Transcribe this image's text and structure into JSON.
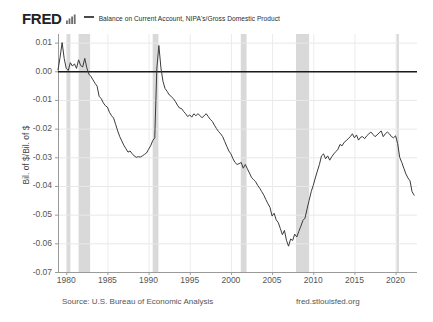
{
  "header": {
    "logo_text": "FRED",
    "logo_icon": "bar-chart-icon",
    "series_legend_label": "Balance on Current Account, NIPA's/Gross Domestic Product"
  },
  "footer": {
    "source": "Source: U.S. Bureau of Economic Analysis",
    "url": "fred.stlouisfed.org"
  },
  "chart_data": {
    "type": "line",
    "title": "Balance on Current Account, NIPA's/Gross Domestic Product",
    "xlabel": "",
    "ylabel": "Bil. of $/Bil. of $",
    "xlim": [
      1979.0,
      2022.6
    ],
    "ylim": [
      -0.07,
      0.013
    ],
    "grid": true,
    "legend_position": "top",
    "line_color": "#3b3b3b",
    "zero_line_color": "#1a1a1a",
    "recession_band_color": "#d9d9d9",
    "xticks": [
      1980,
      1985,
      1990,
      1995,
      2000,
      2005,
      2010,
      2015,
      2020
    ],
    "xticklabels": [
      "1980",
      "1985",
      "1990",
      "1995",
      "2000",
      "2005",
      "2010",
      "2015",
      "2020"
    ],
    "yticks": [
      0.01,
      0.0,
      -0.01,
      -0.02,
      -0.03,
      -0.04,
      -0.05,
      -0.06,
      -0.07
    ],
    "yticklabels": [
      "0.01",
      "0.00",
      "-0.01",
      "-0.02",
      "-0.03",
      "-0.04",
      "-0.05",
      "-0.06",
      "-0.07"
    ],
    "recessions": [
      {
        "start": 1980.0,
        "end": 1980.5
      },
      {
        "start": 1981.5,
        "end": 1982.9
      },
      {
        "start": 1990.5,
        "end": 1991.2
      },
      {
        "start": 2001.2,
        "end": 2001.9
      },
      {
        "start": 2007.9,
        "end": 2009.5
      },
      {
        "start": 2020.1,
        "end": 2020.4
      }
    ],
    "series": [
      {
        "name": "Balance on Current Account, NIPA's/Gross Domestic Product",
        "x": [
          1979.0,
          1979.25,
          1979.5,
          1979.75,
          1980.0,
          1980.25,
          1980.5,
          1980.75,
          1981.0,
          1981.25,
          1981.5,
          1981.75,
          1982.0,
          1982.25,
          1982.5,
          1982.75,
          1983.0,
          1983.25,
          1983.5,
          1983.75,
          1984.0,
          1984.25,
          1984.5,
          1984.75,
          1985.0,
          1985.25,
          1985.5,
          1985.75,
          1986.0,
          1986.25,
          1986.5,
          1986.75,
          1987.0,
          1987.25,
          1987.5,
          1987.75,
          1988.0,
          1988.25,
          1988.5,
          1988.75,
          1989.0,
          1989.25,
          1989.5,
          1989.75,
          1990.0,
          1990.25,
          1990.5,
          1990.75,
          1991.0,
          1991.25,
          1991.5,
          1991.75,
          1992.0,
          1992.25,
          1992.5,
          1992.75,
          1993.0,
          1993.25,
          1993.5,
          1993.75,
          1994.0,
          1994.25,
          1994.5,
          1994.75,
          1995.0,
          1995.25,
          1995.5,
          1995.75,
          1996.0,
          1996.25,
          1996.5,
          1996.75,
          1997.0,
          1997.25,
          1997.5,
          1997.75,
          1998.0,
          1998.25,
          1998.5,
          1998.75,
          1999.0,
          1999.25,
          1999.5,
          1999.75,
          2000.0,
          2000.25,
          2000.5,
          2000.75,
          2001.0,
          2001.25,
          2001.5,
          2001.75,
          2002.0,
          2002.25,
          2002.5,
          2002.75,
          2003.0,
          2003.25,
          2003.5,
          2003.75,
          2004.0,
          2004.25,
          2004.5,
          2004.75,
          2005.0,
          2005.25,
          2005.5,
          2005.75,
          2006.0,
          2006.25,
          2006.5,
          2006.75,
          2007.0,
          2007.25,
          2007.5,
          2007.75,
          2008.0,
          2008.25,
          2008.5,
          2008.75,
          2009.0,
          2009.25,
          2009.5,
          2009.75,
          2010.0,
          2010.25,
          2010.5,
          2010.75,
          2011.0,
          2011.25,
          2011.5,
          2011.75,
          2012.0,
          2012.25,
          2012.5,
          2012.75,
          2013.0,
          2013.25,
          2013.5,
          2013.75,
          2014.0,
          2014.25,
          2014.5,
          2014.75,
          2015.0,
          2015.25,
          2015.5,
          2015.75,
          2016.0,
          2016.25,
          2016.5,
          2016.75,
          2017.0,
          2017.25,
          2017.5,
          2017.75,
          2018.0,
          2018.25,
          2018.5,
          2018.75,
          2019.0,
          2019.25,
          2019.5,
          2019.75,
          2020.0,
          2020.25,
          2020.5,
          2020.75,
          2021.0,
          2021.25,
          2021.5,
          2021.75,
          2022.0,
          2022.25
        ],
        "y": [
          0.0005,
          0.0048,
          0.01,
          0.0045,
          0.001,
          0.0003,
          0.003,
          0.0018,
          0.0026,
          0.001,
          0.004,
          0.002,
          0.0015,
          0.0045,
          0.0012,
          -0.001,
          -0.0018,
          -0.003,
          -0.0042,
          -0.0052,
          -0.0088,
          -0.0095,
          -0.011,
          -0.012,
          -0.0125,
          -0.0143,
          -0.0155,
          -0.0163,
          -0.0185,
          -0.0208,
          -0.0228,
          -0.0243,
          -0.0258,
          -0.027,
          -0.0282,
          -0.0278,
          -0.0287,
          -0.0295,
          -0.03,
          -0.0298,
          -0.0299,
          -0.0295,
          -0.029,
          -0.0285,
          -0.0272,
          -0.026,
          -0.0242,
          -0.0232,
          0.0008,
          0.009,
          0.0012,
          -0.0035,
          -0.006,
          -0.007,
          -0.0082,
          -0.0088,
          -0.0095,
          -0.0105,
          -0.0118,
          -0.0128,
          -0.013,
          -0.014,
          -0.0148,
          -0.0158,
          -0.0152,
          -0.016,
          -0.0148,
          -0.0155,
          -0.0148,
          -0.0155,
          -0.0162,
          -0.0155,
          -0.0148,
          -0.0158,
          -0.0168,
          -0.0175,
          -0.0188,
          -0.02,
          -0.021,
          -0.0218,
          -0.0228,
          -0.0245,
          -0.0262,
          -0.0278,
          -0.0288,
          -0.0305,
          -0.0318,
          -0.0325,
          -0.0322,
          -0.0318,
          -0.0338,
          -0.0325,
          -0.034,
          -0.0355,
          -0.037,
          -0.0378,
          -0.0385,
          -0.0398,
          -0.0408,
          -0.042,
          -0.0432,
          -0.0448,
          -0.0462,
          -0.0475,
          -0.0505,
          -0.0495,
          -0.0518,
          -0.0528,
          -0.0548,
          -0.057,
          -0.0555,
          -0.059,
          -0.061,
          -0.0585,
          -0.059,
          -0.0568,
          -0.0578,
          -0.0558,
          -0.054,
          -0.052,
          -0.0512,
          -0.048,
          -0.045,
          -0.042,
          -0.0398,
          -0.0372,
          -0.0348,
          -0.0325,
          -0.0295,
          -0.0288,
          -0.0305,
          -0.0295,
          -0.031,
          -0.0298,
          -0.0288,
          -0.028,
          -0.0272,
          -0.0255,
          -0.026,
          -0.0248,
          -0.0242,
          -0.0235,
          -0.0228,
          -0.0218,
          -0.0232,
          -0.0222,
          -0.024,
          -0.023,
          -0.0228,
          -0.0235,
          -0.0225,
          -0.0218,
          -0.0212,
          -0.022,
          -0.0228,
          -0.0222,
          -0.0215,
          -0.0208,
          -0.0228,
          -0.0218,
          -0.0212,
          -0.0218,
          -0.0228,
          -0.0232,
          -0.0225,
          -0.0252,
          -0.03,
          -0.0318,
          -0.0338,
          -0.0358,
          -0.0372,
          -0.0382,
          -0.042,
          -0.0432
        ]
      }
    ]
  }
}
